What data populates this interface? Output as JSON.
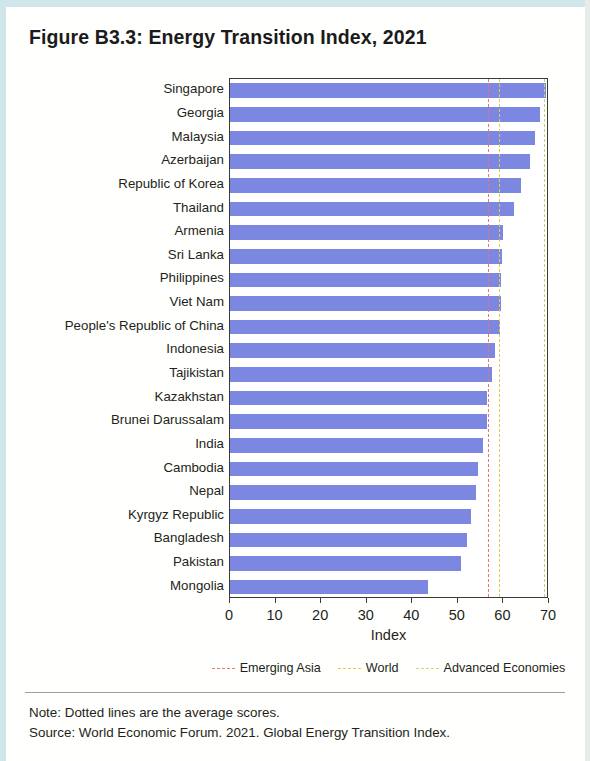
{
  "figure": {
    "title": "Figure B3.3: Energy Transition Index, 2021"
  },
  "footer": {
    "note": "Note: Dotted lines are the average scores.",
    "source": "Source: World Economic Forum. 2021. Global Energy Transition Index."
  },
  "chart_data": {
    "type": "bar",
    "orientation": "horizontal",
    "title": "Figure B3.3: Energy Transition Index, 2021",
    "xlabel": "Index",
    "ylabel": "",
    "xlim": [
      0,
      70
    ],
    "xticks": [
      0,
      10,
      20,
      30,
      40,
      50,
      60,
      70
    ],
    "xticklabels": [
      "0",
      "10",
      "20",
      "30",
      "40",
      "50",
      "60",
      "70"
    ],
    "grid": false,
    "bar_color": "#7b87e0",
    "categories": [
      "Singapore",
      "Georgia",
      "Malaysia",
      "Azerbaijan",
      "Republic of Korea",
      "Thailand",
      "Armenia",
      "Sri Lanka",
      "Philippines",
      "Viet Nam",
      "People's Republic of China",
      "Indonesia",
      "Tajikistan",
      "Kazakhstan",
      "Brunei Darussalam",
      "India",
      "Cambodia",
      "Nepal",
      "Kyrgyz Republic",
      "Bangladesh",
      "Pakistan",
      "Mongolia"
    ],
    "values": [
      69.3,
      68.0,
      67.0,
      65.8,
      63.8,
      62.4,
      60.0,
      59.6,
      59.5,
      59.4,
      59.2,
      58.2,
      57.4,
      56.5,
      56.3,
      55.6,
      54.4,
      54.0,
      52.9,
      51.9,
      50.6,
      43.5
    ],
    "reference_lines": [
      {
        "name": "Emerging Asia",
        "value": 56.6,
        "color": "#e8766a",
        "style": "dashed"
      },
      {
        "name": "World",
        "value": 59.1,
        "color": "#e8c84a",
        "style": "dashed"
      },
      {
        "name": "Advanced Economies",
        "value": 69.0,
        "color": "#b9d96a",
        "style": "dashed"
      }
    ],
    "legend": {
      "position": "bottom",
      "entries": [
        {
          "label": "Emerging Asia",
          "color": "#e8766a"
        },
        {
          "label": "World",
          "color": "#e8c84a"
        },
        {
          "label": "Advanced Economies",
          "color": "#c2de7a"
        }
      ]
    }
  }
}
